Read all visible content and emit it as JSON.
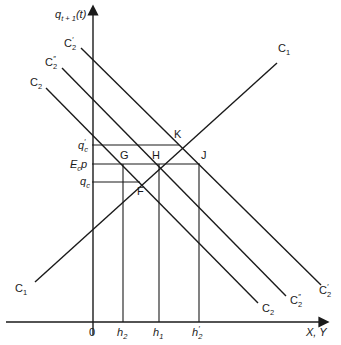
{
  "diagram": {
    "type": "economic-diagram",
    "y_axis_label": {
      "base": "q",
      "sub": "t + 1",
      "suffix": "(t)"
    },
    "x_axis_label": "X, Y",
    "origin_label": "0",
    "curves": [
      {
        "id": "C1",
        "label_left": "C",
        "label_left_sub": "1",
        "label_right": "C",
        "label_right_sub": "1",
        "slope": "upward"
      },
      {
        "id": "C2",
        "label_left": "C",
        "label_left_sub": "2",
        "label_right": "C",
        "label_right_sub": "2",
        "slope": "downward"
      },
      {
        "id": "C2pp",
        "label_left": "C",
        "label_left_sub": "2",
        "label_left_sup": "″",
        "label_right": "C",
        "label_right_sub": "2",
        "label_right_sup": "″",
        "slope": "downward"
      },
      {
        "id": "C2p",
        "label_left": "C",
        "label_left_sub": "2",
        "label_left_sup": "′",
        "label_right": "C",
        "label_right_sub": "2",
        "label_right_sup": "′",
        "slope": "downward"
      }
    ],
    "points": [
      {
        "label": "K"
      },
      {
        "label": "G"
      },
      {
        "label": "H"
      },
      {
        "label": "J"
      },
      {
        "label": "F"
      }
    ],
    "y_ticks": [
      {
        "base": "q",
        "sub": "c",
        "sup": "′"
      },
      {
        "base": "E",
        "sub": "c",
        "suffix": "p"
      },
      {
        "base": "q",
        "sub": "c"
      }
    ],
    "x_ticks": [
      {
        "base": "h",
        "sub": "2"
      },
      {
        "base": "h",
        "sub": "1"
      },
      {
        "base": "h",
        "sub": "2",
        "sup": "′"
      }
    ]
  }
}
